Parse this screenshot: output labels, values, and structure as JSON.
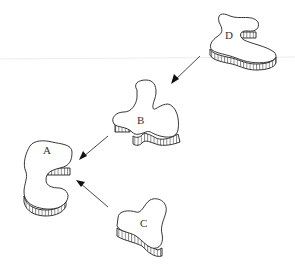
{
  "diagram": {
    "type": "assembly-flow",
    "nodes": [
      {
        "id": "A",
        "label": "A",
        "shape": "c-shaped-slab"
      },
      {
        "id": "B",
        "label": "B",
        "shape": "clover-slab"
      },
      {
        "id": "C",
        "label": "C",
        "shape": "trefoil-slab"
      },
      {
        "id": "D",
        "label": "D",
        "shape": "boot-shaped-slab"
      }
    ],
    "edges": [
      {
        "from": "D",
        "to": "B"
      },
      {
        "from": "B",
        "to": "A"
      },
      {
        "from": "C",
        "to": "A"
      }
    ]
  }
}
